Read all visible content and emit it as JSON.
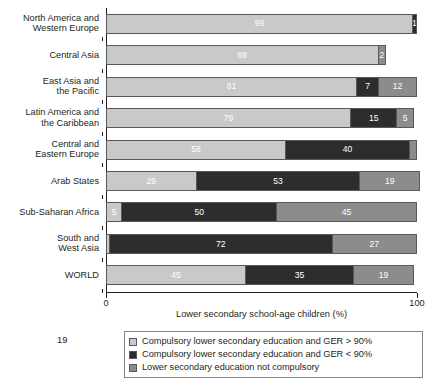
{
  "page": {
    "page_number": "19"
  },
  "chart_data": {
    "type": "bar",
    "orientation": "horizontal",
    "stacked": true,
    "title": "",
    "xlabel": "Lower secondary school-age children (%)",
    "ylabel": "",
    "xlim": [
      0,
      100
    ],
    "xticks": [
      0,
      100
    ],
    "xtick_labels": [
      "0",
      "100"
    ],
    "grid": false,
    "legend_position": "bottom",
    "categories": [
      "North America and\nWestern Europe",
      "Central Asia",
      "East Asia and\nthe Pacific",
      "Latin America and\nthe Caribbean",
      "Central and\nEastern Europe",
      "Arab States",
      "Sub-Saharan Africa",
      "South and\nWest Asia",
      "WORLD"
    ],
    "series": [
      {
        "name": "Compulsory lower secondary education and GER > 90%",
        "color": "#c9c9c9",
        "values": [
          99,
          88,
          81,
          79,
          58,
          29,
          5,
          1,
          45
        ],
        "labels": [
          "99",
          "88",
          "81",
          "79",
          "58",
          "29",
          "5",
          "",
          "45"
        ]
      },
      {
        "name": "Compulsory lower secondary education and GER < 90%",
        "color": "#2d2d2d",
        "values": [
          1,
          0,
          7,
          15,
          40,
          53,
          50,
          72,
          35
        ],
        "labels": [
          "1",
          "",
          "7",
          "15",
          "40",
          "53",
          "50",
          "72",
          "35"
        ]
      },
      {
        "name": "Lower secondary education not compulsory",
        "color": "#8c8c8c",
        "values": [
          0,
          2,
          12,
          5,
          2,
          19,
          45,
          27,
          19
        ],
        "labels": [
          "",
          "2",
          "12",
          "5",
          "",
          "19",
          "45",
          "27",
          "19"
        ]
      }
    ],
    "legend_entries": [
      "Compulsory lower secondary education and GER > 90%",
      "Compulsory lower secondary education and GER < 90%",
      "Lower secondary education not compulsory"
    ],
    "colors": {
      "series_1": "#c9c9c9",
      "series_2": "#2d2d2d",
      "series_3": "#8c8c8c",
      "axis": "#231f20",
      "text": "#231f20",
      "value_label": "#ffffff"
    }
  }
}
